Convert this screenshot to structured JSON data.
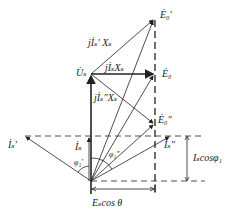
{
  "diagram": {
    "type": "phasor diagram",
    "colors": {
      "line": "#222222",
      "background": "#ffffff"
    },
    "labels": {
      "E0_prime": "Ė₀′",
      "E0": "Ė₀",
      "E0_dprime": "Ė₀″",
      "Us": "U̇ₛ",
      "jIs_prime_Xs": "jİₛ′ Xₛ",
      "jIs_Xs": "jİₛXₛ",
      "jIs_dprime_Xs": "jİₛ″Xₛ",
      "Is_prime": "İₛ′",
      "Is": "İₛ",
      "Is_dprime": "İₛ″",
      "phi1_prime": "φ₁′",
      "phi1_dprime": "φ₁″",
      "Is_cos_phi": "Iₛcosφ₁",
      "Es_cos_theta": "Eₛcos θ"
    }
  }
}
